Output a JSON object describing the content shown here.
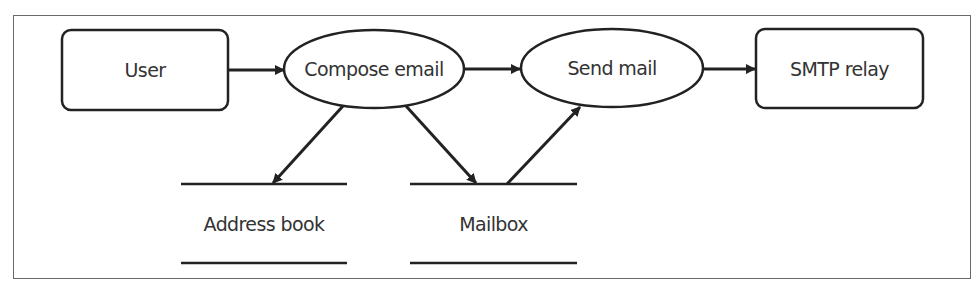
{
  "diagram": {
    "type": "data-flow-diagram",
    "colors": {
      "stroke": "#222222",
      "frame": "#6a6a6a",
      "text": "#333333",
      "background": "#ffffff"
    },
    "nodes": {
      "user": {
        "label": "User",
        "shape": "rounded-rectangle",
        "role": "external-entity"
      },
      "compose_email": {
        "label": "Compose email",
        "shape": "ellipse",
        "role": "process"
      },
      "send_mail": {
        "label": "Send mail",
        "shape": "ellipse",
        "role": "process"
      },
      "smtp_relay": {
        "label": "SMTP relay",
        "shape": "rounded-rectangle",
        "role": "external-entity"
      },
      "address_book": {
        "label": "Address book",
        "shape": "data-store",
        "role": "data-store"
      },
      "mailbox": {
        "label": "Mailbox",
        "shape": "data-store",
        "role": "data-store"
      }
    },
    "edges": [
      {
        "from": "User",
        "to": "Compose email"
      },
      {
        "from": "Compose email",
        "to": "Send mail"
      },
      {
        "from": "Send mail",
        "to": "SMTP relay"
      },
      {
        "from": "Compose email",
        "to": "Address book"
      },
      {
        "from": "Compose email",
        "to": "Mailbox"
      },
      {
        "from": "Mailbox",
        "to": "Send mail"
      }
    ]
  }
}
